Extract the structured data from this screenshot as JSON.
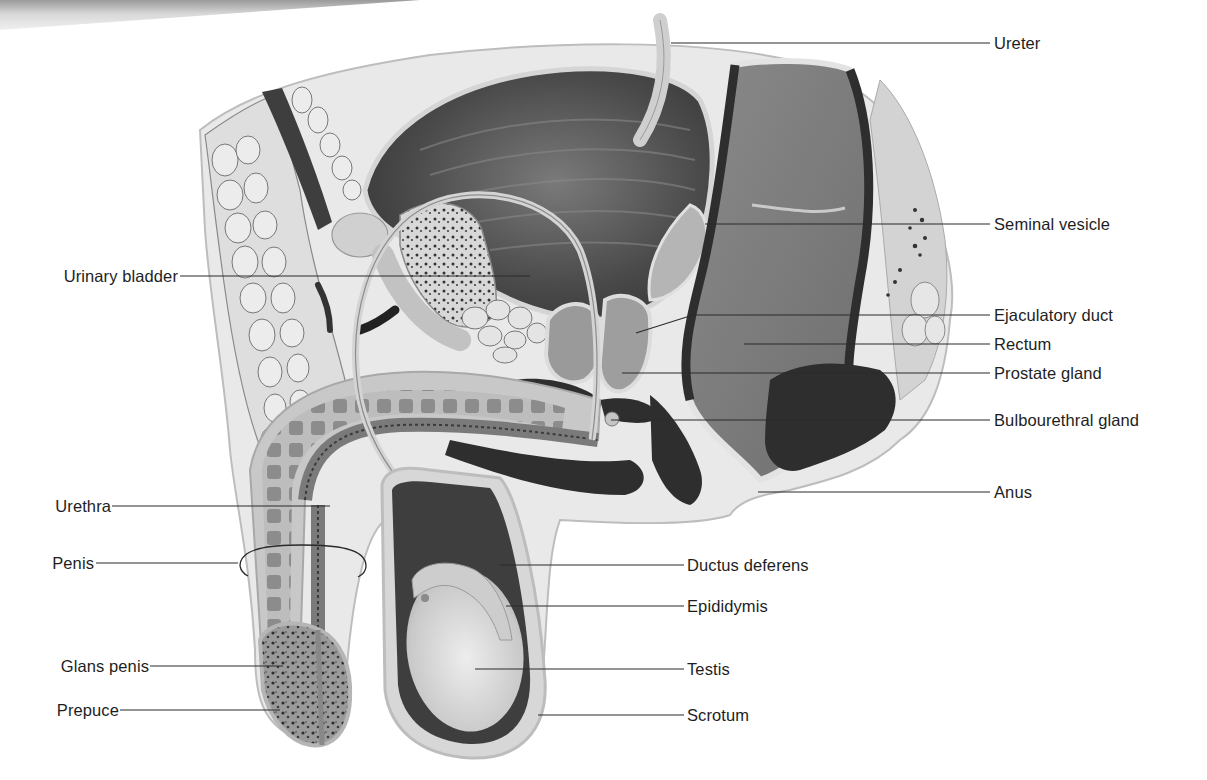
{
  "figure": {
    "type": "anatomical-illustration",
    "palette": {
      "background": "#ffffff",
      "leader_line": "#2a2a2a",
      "label_text": "#1e1e1e",
      "dark_tissue": "#2e2e2e",
      "mid_tissue": "#6e6e6e",
      "light_tissue": "#cfcfcf",
      "fat_tissue": "#e6e6e6"
    }
  },
  "labels": {
    "left": [
      {
        "id": "urinary-bladder",
        "text": "Urinary bladder",
        "x": 176,
        "y": 276,
        "line_to_x": 530,
        "line_y": 276
      },
      {
        "id": "urethra",
        "text": "Urethra",
        "x": 110,
        "y": 506,
        "line_to_x": 330,
        "line_y": 506
      },
      {
        "id": "penis",
        "text": "Penis",
        "x": 92,
        "y": 563,
        "line_to_x": 238,
        "line_y": 563
      },
      {
        "id": "glans-penis",
        "text": "Glans penis",
        "x": 147,
        "y": 666,
        "line_to_x": 283,
        "line_y": 666
      },
      {
        "id": "prepuce",
        "text": "Prepuce",
        "x": 118,
        "y": 710,
        "line_to_x": 280,
        "line_y": 710
      }
    ],
    "right": [
      {
        "id": "ureter",
        "text": "Ureter",
        "x": 994,
        "y": 43,
        "line_from_x": 671,
        "line_y": 43
      },
      {
        "id": "seminal-vesicle",
        "text": "Seminal vesicle",
        "x": 994,
        "y": 224,
        "line_from_x": 705,
        "line_y": 224
      },
      {
        "id": "ejaculatory-duct",
        "text": "Ejaculatory duct",
        "x": 994,
        "y": 315,
        "line_from_x": 693,
        "line_y": 315,
        "angled_to_x": 636,
        "angled_to_y": 333
      },
      {
        "id": "rectum",
        "text": "Rectum",
        "x": 994,
        "y": 344,
        "line_from_x": 744,
        "line_y": 344
      },
      {
        "id": "prostate-gland",
        "text": "Prostate gland",
        "x": 994,
        "y": 373,
        "line_from_x": 622,
        "line_y": 373
      },
      {
        "id": "bulbourethral-gland",
        "text": "Bulbourethral gland",
        "x": 994,
        "y": 420,
        "line_from_x": 611,
        "line_y": 420
      },
      {
        "id": "anus",
        "text": "Anus",
        "x": 994,
        "y": 492,
        "line_from_x": 758,
        "line_y": 492
      },
      {
        "id": "ductus-deferens",
        "text": "Ductus deferens",
        "x": 687,
        "y": 565,
        "line_from_x": 500,
        "line_y": 565
      },
      {
        "id": "epididymis",
        "text": "Epididymis",
        "x": 687,
        "y": 606,
        "line_from_x": 506,
        "line_y": 606
      },
      {
        "id": "testis",
        "text": "Testis",
        "x": 687,
        "y": 669,
        "line_from_x": 475,
        "line_y": 669
      },
      {
        "id": "scrotum",
        "text": "Scrotum",
        "x": 687,
        "y": 715,
        "line_from_x": 538,
        "line_y": 715
      }
    ]
  },
  "penis_bracket": {
    "cx": 302,
    "cy": 560,
    "rx": 64,
    "ry": 15
  }
}
